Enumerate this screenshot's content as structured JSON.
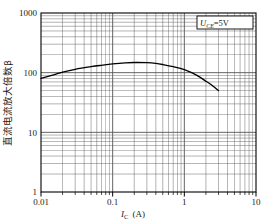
{
  "chart_data": {
    "type": "line",
    "title": "",
    "xlabel": "I_C (A)",
    "xlabel_main": "I",
    "xlabel_sub": "C",
    "xlabel_unit": "(A)",
    "ylabel": "直流电流放大倍数β",
    "xscale": "log",
    "yscale": "log",
    "xlim": [
      0.01,
      10
    ],
    "ylim": [
      1,
      1000
    ],
    "xticks": [
      "0.01",
      "0.1",
      "1",
      "10"
    ],
    "xtick_values": [
      0.01,
      0.1,
      1,
      10
    ],
    "yticks": [
      "1",
      "10",
      "100",
      "1000"
    ],
    "ytick_values": [
      1,
      10,
      100,
      1000
    ],
    "grid": true,
    "grid_minor": true,
    "grid_color": "#555555",
    "line_color": "#000000",
    "legend_position": "top-right",
    "legend": [
      {
        "label": "U_CE=5V",
        "symbol": "U",
        "sub": "CE",
        "value": "=5V"
      }
    ],
    "series": [
      {
        "name": "beta vs Ic",
        "x": [
          0.01,
          0.015,
          0.02,
          0.03,
          0.05,
          0.07,
          0.1,
          0.15,
          0.2,
          0.3,
          0.4,
          0.5,
          0.7,
          1.0,
          1.5,
          2.0,
          2.5,
          3.0
        ],
        "values": [
          80,
          92,
          102,
          114,
          126,
          133,
          140,
          146,
          148,
          147,
          143,
          137,
          126,
          112,
          90,
          72,
          60,
          50
        ]
      }
    ],
    "annotations": []
  },
  "figure": {
    "background": "#ffffff",
    "border_color": "#000000",
    "plot_left": 41,
    "plot_top": 13,
    "plot_right": 256,
    "plot_bottom": 192
  }
}
